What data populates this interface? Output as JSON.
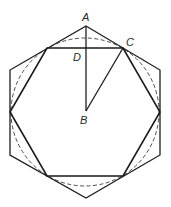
{
  "diagram": {
    "type": "geometry",
    "labels": {
      "A": "A",
      "B": "B",
      "C": "C",
      "D": "D"
    },
    "points": {
      "A": [
        86,
        26
      ],
      "B": [
        86,
        111
      ],
      "C": [
        123,
        48
      ],
      "D": [
        86,
        48
      ]
    },
    "outer_hexagon": [
      [
        86,
        26
      ],
      [
        160,
        70
      ],
      [
        160,
        155
      ],
      [
        86,
        198
      ],
      [
        10,
        155
      ],
      [
        10,
        70
      ]
    ],
    "inner_hexagon": [
      [
        47,
        48
      ],
      [
        123,
        48
      ],
      [
        160,
        112
      ],
      [
        123,
        176
      ],
      [
        47,
        176
      ],
      [
        10,
        112
      ]
    ],
    "circle": {
      "cx": 85,
      "cy": 112,
      "r": 74,
      "style": "dashed"
    },
    "segments": [
      {
        "from": "A",
        "to": "B"
      },
      {
        "from": "B",
        "to": "C"
      }
    ],
    "colors": {
      "line": "#1e1e1e",
      "background": "#ffffff"
    }
  }
}
